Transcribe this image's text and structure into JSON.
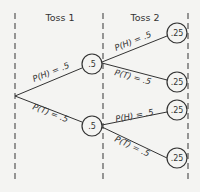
{
  "diagram": {
    "type": "probability-tree",
    "columns": [
      {
        "title": "Toss 1"
      },
      {
        "title": "Toss 2"
      }
    ],
    "root": {},
    "toss1": {
      "nodes": [
        {
          "value": ".5",
          "branch_label": "P(H) = .5"
        },
        {
          "value": ".5",
          "branch_label": "P(T) = .5"
        }
      ]
    },
    "toss2": {
      "nodes": [
        {
          "value": ".25",
          "branch_label": "P(H) = .5"
        },
        {
          "value": ".25",
          "branch_label": "P(T) = .5"
        },
        {
          "value": ".25",
          "branch_label": "P(H) = .5"
        },
        {
          "value": ".25",
          "branch_label": "P(T) = .5"
        }
      ]
    },
    "colors": {
      "ink": "#333333",
      "background": "#f4f4f2"
    }
  }
}
